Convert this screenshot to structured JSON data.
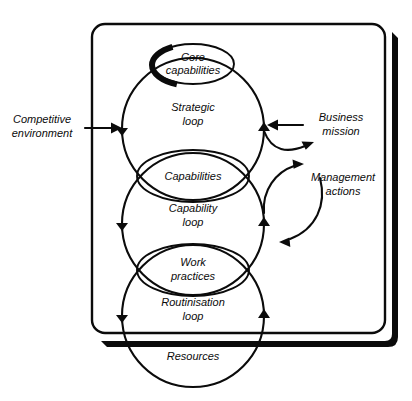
{
  "diagram": {
    "type": "concept-diagram",
    "colors": {
      "ink": "#0b0b0b",
      "background": "#ffffff"
    },
    "frame": {
      "name": "organisation-boundary",
      "shape": "rounded-rectangle",
      "has_drop_shadow": true
    },
    "loops": [
      {
        "id": "strategic",
        "label_line1": "Strategic",
        "label_line2": "loop",
        "direction": "clockwise"
      },
      {
        "id": "capability",
        "label_line1": "Capability",
        "label_line2": "loop",
        "direction": "clockwise"
      },
      {
        "id": "routinisation",
        "label_line1": "Routinisation",
        "label_line2": "loop",
        "direction": "clockwise"
      }
    ],
    "nodes": [
      {
        "id": "core-capabilities",
        "label_line1": "Core",
        "label_line2": "capabilities",
        "emphasis": "shadowed-ellipse"
      },
      {
        "id": "capabilities",
        "label_line1": "Capabilities",
        "label_line2": "",
        "emphasis": "lens"
      },
      {
        "id": "work-practices",
        "label_line1": "Work",
        "label_line2": "practices",
        "emphasis": "lens"
      },
      {
        "id": "resources",
        "label_line1": "Resources",
        "label_line2": "",
        "emphasis": "plain"
      }
    ],
    "external": [
      {
        "id": "competitive-environment",
        "label_line1": "Competitive",
        "label_line2": "environment",
        "side": "left",
        "arrow": "into-diagram-right"
      },
      {
        "id": "business-mission",
        "label_line1": "Business",
        "label_line2": "mission",
        "side": "right",
        "arrow": "into-diagram-left"
      },
      {
        "id": "management-actions",
        "label_line1": "Management",
        "label_line2": "actions",
        "side": "right",
        "arrow": "bidirectional-curved"
      }
    ]
  }
}
